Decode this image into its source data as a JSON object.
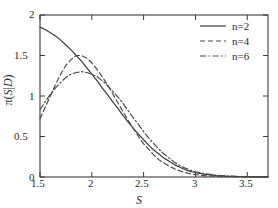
{
  "chart_data": {
    "type": "line",
    "title": "",
    "xlabel": "S",
    "ylabel": "π(S|D)",
    "xlim": [
      1.5,
      3.7
    ],
    "ylim": [
      0,
      2
    ],
    "grid": false,
    "legend_position": "top-right",
    "xticks": [
      "1.5",
      "2",
      "2.5",
      "3",
      "3.5"
    ],
    "xtick_values": [
      1.5,
      2,
      2.5,
      3,
      3.5
    ],
    "yticks": [
      "0",
      "0.5",
      "1",
      "1.5",
      "2"
    ],
    "ytick_values": [
      0,
      0.5,
      1,
      1.5,
      2
    ],
    "x": [
      1.5,
      1.55,
      1.6,
      1.65,
      1.7,
      1.75,
      1.8,
      1.85,
      1.9,
      1.95,
      2.0,
      2.05,
      2.1,
      2.15,
      2.2,
      2.25,
      2.3,
      2.35,
      2.4,
      2.45,
      2.5,
      2.55,
      2.6,
      2.65,
      2.7,
      2.75,
      2.8,
      2.85,
      2.9,
      2.95,
      3.0,
      3.1,
      3.2,
      3.3,
      3.4,
      3.5,
      3.6,
      3.7
    ],
    "series": [
      {
        "name": "n=2",
        "label": "n=2",
        "linestyle": "solid",
        "color": "#3b3b3b",
        "values": [
          1.85,
          1.82,
          1.78,
          1.74,
          1.69,
          1.63,
          1.57,
          1.5,
          1.43,
          1.35,
          1.27,
          1.19,
          1.1,
          1.02,
          0.93,
          0.85,
          0.76,
          0.68,
          0.6,
          0.53,
          0.46,
          0.39,
          0.33,
          0.28,
          0.23,
          0.19,
          0.15,
          0.12,
          0.09,
          0.07,
          0.055,
          0.032,
          0.018,
          0.01,
          0.006,
          0.003,
          0.002,
          0.001
        ]
      },
      {
        "name": "n=4",
        "label": "n=4",
        "linestyle": "dashed",
        "color": "#4a4a4a",
        "values": [
          0.72,
          0.86,
          1.0,
          1.14,
          1.27,
          1.38,
          1.45,
          1.5,
          1.5,
          1.47,
          1.41,
          1.33,
          1.24,
          1.14,
          1.03,
          0.92,
          0.81,
          0.7,
          0.6,
          0.5,
          0.41,
          0.34,
          0.27,
          0.21,
          0.17,
          0.13,
          0.1,
          0.075,
          0.055,
          0.04,
          0.029,
          0.015,
          0.008,
          0.004,
          0.002,
          0.001,
          0.001,
          0.0
        ]
      },
      {
        "name": "n=6",
        "label": "n=6",
        "linestyle": "dashdot",
        "color": "#4a4a4a",
        "values": [
          0.83,
          0.93,
          1.02,
          1.1,
          1.17,
          1.23,
          1.27,
          1.29,
          1.3,
          1.29,
          1.27,
          1.24,
          1.19,
          1.13,
          1.06,
          0.99,
          0.91,
          0.82,
          0.73,
          0.65,
          0.56,
          0.48,
          0.41,
          0.34,
          0.28,
          0.23,
          0.18,
          0.14,
          0.11,
          0.085,
          0.065,
          0.038,
          0.022,
          0.012,
          0.007,
          0.004,
          0.002,
          0.001
        ]
      }
    ]
  },
  "legend": {
    "entries": [
      {
        "label": "n=2"
      },
      {
        "label": "n=4"
      },
      {
        "label": "n=6"
      }
    ]
  },
  "axes": {
    "x_title": "S",
    "y_title_pi": "π",
    "y_title_open": "(",
    "y_title_s": "S",
    "y_title_bar": "|",
    "y_title_d": "D",
    "y_title_close": ")"
  },
  "colors": {
    "axis": "#3b3b3b",
    "text": "#2b2b2b",
    "background": "#ffffff",
    "curve_solid": "#3b3b3b",
    "curve_dashed": "#4a4a4a"
  }
}
